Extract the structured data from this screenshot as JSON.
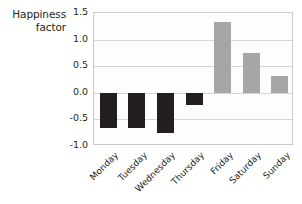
{
  "chart_data": {
    "type": "bar",
    "title": "",
    "subtitle": "",
    "ylabel": "Happiness\nfactor",
    "ylabel_line1": "Happiness",
    "ylabel_line2": "factor",
    "xlabel": "",
    "categories": [
      "Monday",
      "Tuesday",
      "Wednesday",
      "Thursday",
      "Friday",
      "Saturday",
      "Sunday"
    ],
    "values": [
      -0.67,
      -0.67,
      -0.75,
      -0.23,
      1.33,
      0.75,
      0.31
    ],
    "ylim": [
      -1.0,
      1.5
    ],
    "yticks": [
      "1.5",
      "1.0",
      "0.5",
      "0.0",
      "-0.5",
      "-1.0"
    ],
    "ytick_values": [
      1.5,
      1.0,
      0.5,
      0.0,
      -0.5,
      -1.0
    ],
    "grid": true,
    "legend": "none",
    "colors": {
      "negative_bar": "#231f20",
      "positive_bar": "#a6a6a6",
      "gridline": "#d6d6d6",
      "axis": "#c9c9c9",
      "text": "#231f20",
      "background": "#ffffff"
    }
  }
}
